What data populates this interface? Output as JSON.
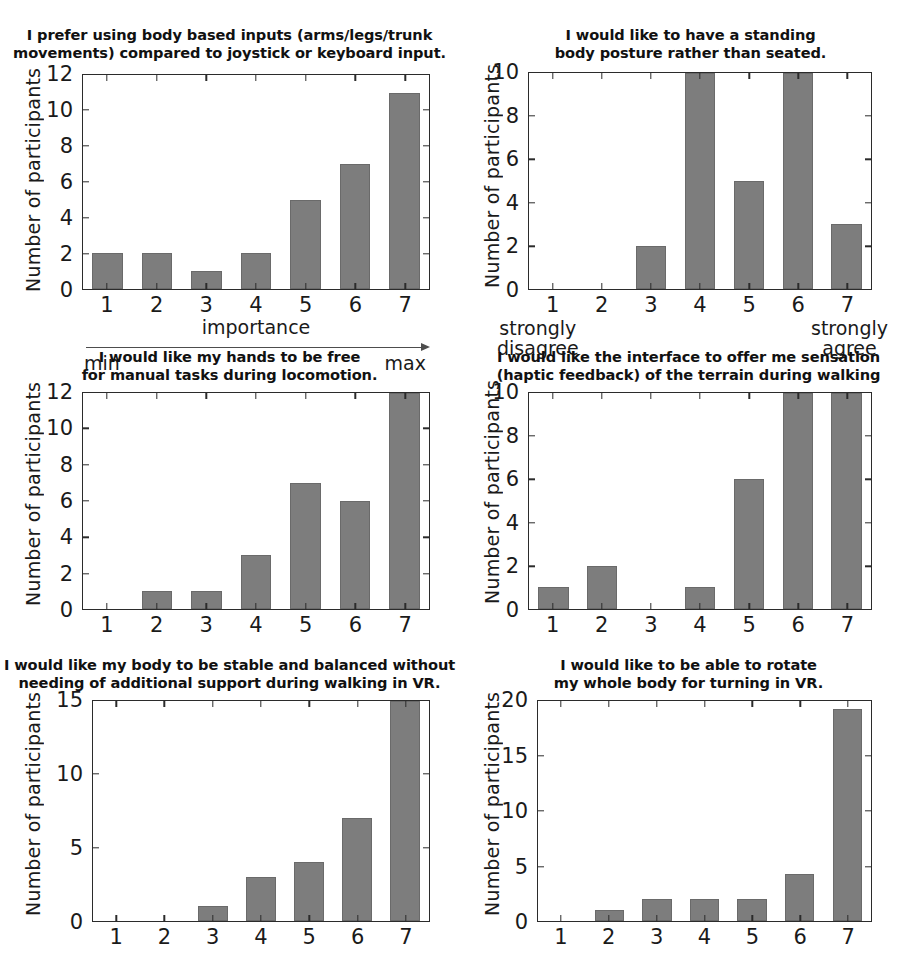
{
  "figure": {
    "y_axis_label": "Number of participants",
    "categories": [
      "1",
      "2",
      "3",
      "4",
      "5",
      "6",
      "7"
    ]
  },
  "panels": [
    {
      "id": "body-based-inputs",
      "title": "I prefer using body based inputs (arms/legs/trunk\nmovements) compared to joystick or keyboard input.",
      "xlabel": "importance",
      "scale_min": "min",
      "scale_max": "max",
      "ylabel": "Number of participants",
      "yticks": [
        "0",
        "2",
        "4",
        "6",
        "8",
        "10",
        "12"
      ]
    },
    {
      "id": "standing-posture",
      "title": "I would like to have a standing\nbody posture rather than seated.",
      "scale_min": "strongly\ndisagree",
      "scale_max": "strongly\nagree",
      "ylabel": "Number of participants",
      "yticks": [
        "0",
        "2",
        "4",
        "6",
        "8",
        "10"
      ]
    },
    {
      "id": "hands-free",
      "title": "I would like my hands to be free\nfor manual tasks during locomotion.",
      "ylabel": "Number of participants",
      "yticks": [
        "0",
        "2",
        "4",
        "6",
        "8",
        "10",
        "12"
      ]
    },
    {
      "id": "haptic-feedback",
      "title": "I would like the interface to offer me sensation\n(haptic feedback) of the terrain during walking",
      "ylabel": "Number of participants",
      "yticks": [
        "0",
        "2",
        "4",
        "6",
        "8",
        "10"
      ]
    },
    {
      "id": "stable-balanced",
      "title": "I would like my body to be stable and balanced without\nneeding of additional support during walking in VR.",
      "ylabel": "Number of participants",
      "yticks": [
        "0",
        "5",
        "10",
        "15"
      ]
    },
    {
      "id": "rotate-body",
      "title": "I would like to be able to rotate\nmy whole body for turning in VR.",
      "ylabel": "Number of participants",
      "yticks": [
        "0",
        "5",
        "10",
        "15",
        "20"
      ]
    }
  ],
  "chart_data": [
    {
      "type": "bar",
      "title": "I prefer using body based inputs (arms/legs/trunk movements) compared to joystick or keyboard input.",
      "xlabel": "importance",
      "ylabel": "Number of participants",
      "categories": [
        "1",
        "2",
        "3",
        "4",
        "5",
        "6",
        "7"
      ],
      "values": [
        2,
        2,
        1,
        2,
        5,
        7,
        11
      ],
      "ylim": [
        0,
        12
      ],
      "yticks": [
        0,
        2,
        4,
        6,
        8,
        10,
        12
      ],
      "grid": false,
      "scale_anchor_low": "min",
      "scale_anchor_high": "max",
      "bar_color": "#7d7d7d"
    },
    {
      "type": "bar",
      "title": "I would like to have a standing body posture rather than seated.",
      "xlabel": "",
      "ylabel": "Number of participants",
      "categories": [
        "1",
        "2",
        "3",
        "4",
        "5",
        "6",
        "7"
      ],
      "values": [
        0,
        0,
        2,
        10,
        5,
        10,
        3
      ],
      "ylim": [
        0,
        10
      ],
      "yticks": [
        0,
        2,
        4,
        6,
        8,
        10
      ],
      "grid": false,
      "note": "bars at 4 and 6 are clipped at the axis maximum of 10",
      "scale_anchor_low": "strongly disagree",
      "scale_anchor_high": "strongly agree",
      "bar_color": "#7d7d7d"
    },
    {
      "type": "bar",
      "title": "I would like my hands to be free for manual tasks during locomotion.",
      "xlabel": "",
      "ylabel": "Number of participants",
      "categories": [
        "1",
        "2",
        "3",
        "4",
        "5",
        "6",
        "7"
      ],
      "values": [
        0,
        1,
        1,
        3,
        7,
        6,
        12
      ],
      "ylim": [
        0,
        12
      ],
      "yticks": [
        0,
        2,
        4,
        6,
        8,
        10,
        12
      ],
      "grid": false,
      "note": "bar at 7 is clipped at the axis maximum of 12",
      "bar_color": "#7d7d7d"
    },
    {
      "type": "bar",
      "title": "I would like the interface to offer me sensation (haptic feedback) of the terrain during walking",
      "xlabel": "",
      "ylabel": "Number of participants",
      "categories": [
        "1",
        "2",
        "3",
        "4",
        "5",
        "6",
        "7"
      ],
      "values": [
        1,
        2,
        0,
        1,
        6,
        10,
        10
      ],
      "ylim": [
        0,
        10
      ],
      "yticks": [
        0,
        2,
        4,
        6,
        8,
        10
      ],
      "grid": false,
      "note": "bars at 6 and 7 are clipped at the axis maximum of 10",
      "bar_color": "#7d7d7d"
    },
    {
      "type": "bar",
      "title": "I would like my body to be stable and balanced without needing of additional support during walking in VR.",
      "xlabel": "",
      "ylabel": "Number of participants",
      "categories": [
        "1",
        "2",
        "3",
        "4",
        "5",
        "6",
        "7"
      ],
      "values": [
        0,
        0,
        1,
        3,
        4,
        7,
        15
      ],
      "ylim": [
        0,
        15
      ],
      "yticks": [
        0,
        5,
        10,
        15
      ],
      "grid": false,
      "note": "bar at 7 is clipped at the axis maximum of 15",
      "bar_color": "#7d7d7d"
    },
    {
      "type": "bar",
      "title": "I would like to be able to rotate my whole body for turning in VR.",
      "xlabel": "",
      "ylabel": "Number of participants",
      "categories": [
        "1",
        "2",
        "3",
        "4",
        "5",
        "6",
        "7"
      ],
      "values": [
        0,
        1,
        2,
        2,
        2,
        4.3,
        19.3
      ],
      "ylim": [
        0,
        20
      ],
      "yticks": [
        0,
        5,
        10,
        15,
        20
      ],
      "grid": false,
      "bar_color": "#7d7d7d"
    }
  ]
}
